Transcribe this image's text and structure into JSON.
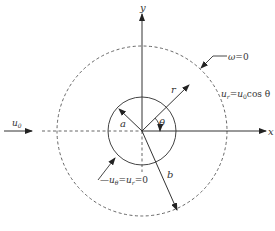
{
  "diagram": {
    "type": "flow-around-cylinder",
    "labels": {
      "y_axis": "y",
      "x_axis": "x",
      "inner_radius": "a",
      "outer_radius": "b",
      "radial": "r",
      "angle": "θ",
      "freestream": "u",
      "freestream_sub": "0",
      "vorticity_bc_lhs": "ω",
      "vorticity_bc_rhs": "=0",
      "far_bc_u": "u",
      "far_bc_sub": "r",
      "far_bc_eq": "=",
      "far_bc_u0": "u",
      "far_bc_u0_sub": "0",
      "far_bc_cos": "cos θ",
      "wall_bc_u1": "u",
      "wall_bc_sub1": "θ",
      "wall_bc_eq1": "=",
      "wall_bc_u2": "u",
      "wall_bc_sub2": "r",
      "wall_bc_eq2": "=0"
    },
    "colors": {
      "line": "#333333",
      "dashed": "#555555"
    }
  }
}
